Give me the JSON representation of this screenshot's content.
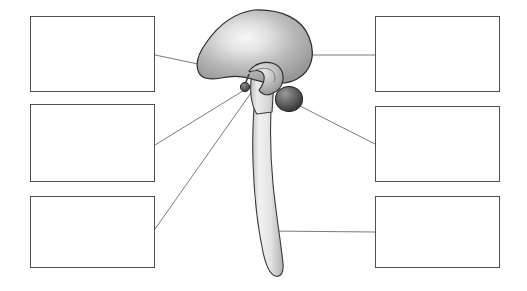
{
  "diagram": {
    "kind": "anatomy-labeling-worksheet",
    "background_color": "#ffffff",
    "box_border_color": "#4f4f4f",
    "leader_line_color": "#6b6b6b",
    "structures": [
      {
        "name": "cerebrum",
        "description": "large lobed mass at top of diagram",
        "fill_center": "#f2f2f2",
        "fill_edge": "#9a9a9a",
        "outline": "#2b2b2b"
      },
      {
        "name": "corpus-callosum",
        "description": "curved band beneath cerebrum",
        "fill_center": "#d8d8d8",
        "fill_edge": "#8f8f8f",
        "outline": "#2b2b2b"
      },
      {
        "name": "pituitary-gland",
        "description": "small dark nub on stalk below cerebrum",
        "fill_center": "#8a8a8a",
        "fill_edge": "#4a4a4a",
        "outline": "#2b2b2b"
      },
      {
        "name": "cerebellum",
        "description": "dark rounded sphere at rear base of brain",
        "fill_center": "#8d8d8d",
        "fill_edge": "#3c3c3c",
        "outline": "#232323"
      },
      {
        "name": "brainstem",
        "description": "tapering column descending from brain",
        "fill_center": "#ededed",
        "fill_edge": "#b5b5b5",
        "outline": "#3a3a3a"
      },
      {
        "name": "spinal-cord",
        "description": "long curving tube ending in rounded tip",
        "fill_center": "#ededed",
        "fill_edge": "#b5b5b5",
        "outline": "#3a3a3a"
      }
    ]
  },
  "label_boxes": {
    "left": [
      {
        "id": "label-box-left-1",
        "value": "",
        "placeholder": ""
      },
      {
        "id": "label-box-left-2",
        "value": "",
        "placeholder": ""
      },
      {
        "id": "label-box-left-3",
        "value": "",
        "placeholder": ""
      }
    ],
    "right": [
      {
        "id": "label-box-right-1",
        "value": "",
        "placeholder": ""
      },
      {
        "id": "label-box-right-2",
        "value": "",
        "placeholder": ""
      },
      {
        "id": "label-box-right-3",
        "value": "",
        "placeholder": ""
      }
    ]
  },
  "leader_lines": [
    {
      "from_box": "label-box-left-1",
      "to_structure": "cerebrum"
    },
    {
      "from_box": "label-box-left-2",
      "to_structure": "pituitary-gland"
    },
    {
      "from_box": "label-box-left-3",
      "to_structure": "brainstem"
    },
    {
      "from_box": "label-box-right-1",
      "to_structure": "cerebrum"
    },
    {
      "from_box": "label-box-right-2",
      "to_structure": "cerebellum"
    },
    {
      "from_box": "label-box-right-3",
      "to_structure": "spinal-cord"
    }
  ]
}
